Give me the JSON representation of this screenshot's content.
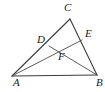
{
  "figure": {
    "type": "geometry-diagram",
    "shape": "triangle-with-cevians",
    "background_color": "#ffffff",
    "stroke_color": "#3c3c3c",
    "label_color": "#1a1a1a",
    "stroke_width": 1,
    "width": 105,
    "height": 92
  },
  "points": {
    "A": {
      "label": "A",
      "x": 12,
      "y": 76,
      "label_x": 13,
      "label_y": 77
    },
    "B": {
      "label": "B",
      "x": 97,
      "y": 75,
      "label_x": 96,
      "label_y": 77
    },
    "C": {
      "label": "C",
      "x": 70,
      "y": 19,
      "label_x": 64,
      "label_y": 2
    },
    "D": {
      "label": "D",
      "x": 49,
      "y": 46,
      "label_x": 37,
      "label_y": 34
    },
    "E": {
      "label": "E",
      "x": 82,
      "y": 40,
      "label_x": 85,
      "label_y": 28
    },
    "F": {
      "label": "F",
      "x": 57,
      "y": 50,
      "label_x": 58,
      "label_y": 51
    }
  },
  "segments": [
    {
      "name": "side-AB",
      "from": "A",
      "to": "B"
    },
    {
      "name": "side-AC",
      "from": "A",
      "to": "C"
    },
    {
      "name": "side-BC",
      "from": "B",
      "to": "C"
    },
    {
      "name": "cevian-AE",
      "from": "A",
      "to": "E"
    },
    {
      "name": "cevian-BD",
      "from": "B",
      "to": "D"
    }
  ]
}
